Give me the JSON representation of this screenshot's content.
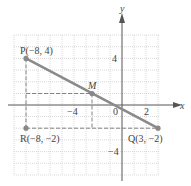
{
  "figure": {
    "axes": {
      "x_label": "x",
      "y_label": "y",
      "origin_label": "0",
      "x_ticks": [
        {
          "value": -4,
          "label": "−4"
        },
        {
          "value": 2,
          "label": "2"
        }
      ],
      "y_ticks": [
        {
          "value": 4,
          "label": "4"
        },
        {
          "value": -4,
          "label": "−4"
        }
      ],
      "grid": {
        "x_min": -9,
        "x_max": 4,
        "y_min": -6,
        "y_max": 6
      }
    },
    "points": {
      "P": {
        "label": "P(−8, 4)",
        "x": -8,
        "y": 4
      },
      "Q": {
        "label": "Q(3, −2)",
        "x": 3,
        "y": -2
      },
      "R": {
        "label": "R(−8, −2)",
        "x": -8,
        "y": -2
      },
      "M": {
        "label": "M",
        "x": -2.5,
        "y": 1
      }
    },
    "colors": {
      "segment": "#8a8a8a",
      "axis": "#555555",
      "grid": "#c8c8c8",
      "dashed": "#777777"
    }
  }
}
